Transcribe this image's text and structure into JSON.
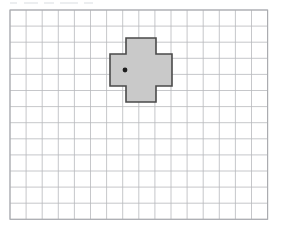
{
  "figure": {
    "kind": "grid-diagram",
    "title": "",
    "background_color": "#ffffff",
    "width_px": 283,
    "height_px": 230
  },
  "grid": {
    "name": "square-grid",
    "columns": 16,
    "rows": 13,
    "cell_size_px": 16.1,
    "origin_x_px": 10,
    "origin_y_px": 10,
    "line_color": "#b7b9bd",
    "border_color": "#a9abaf",
    "line_width_px": 0.8,
    "border_width_px": 1.1,
    "visible": true
  },
  "shape": {
    "name": "plus-polygon",
    "type": "cross",
    "fill_color": "#c9c9c9",
    "stroke_color": "#4a4a4a",
    "stroke_width_px": 1.6,
    "arm_width_cells": 2,
    "total_span_cells": 4,
    "bounds_px": {
      "x": 110,
      "y": 38,
      "width": 62,
      "height": 64
    },
    "vertices_px": [
      [
        126,
        38
      ],
      [
        156,
        38
      ],
      [
        156,
        54
      ],
      [
        172,
        54
      ],
      [
        172,
        86
      ],
      [
        156,
        86
      ],
      [
        156,
        102
      ],
      [
        126,
        102
      ],
      [
        126,
        86
      ],
      [
        110,
        86
      ],
      [
        110,
        54
      ],
      [
        126,
        54
      ]
    ]
  },
  "marker": {
    "name": "point-marker",
    "type": "dot",
    "color": "#1d1d1d",
    "radius_px": 2.4,
    "position_px": {
      "x": 125,
      "y": 70
    },
    "label": ""
  },
  "artifacts": {
    "top_strip_smudges": [
      {
        "left_px": 10,
        "width_px": 7
      },
      {
        "left_px": 24,
        "width_px": 14
      },
      {
        "left_px": 44,
        "width_px": 10
      },
      {
        "left_px": 60,
        "width_px": 18
      },
      {
        "left_px": 84,
        "width_px": 9
      }
    ]
  }
}
